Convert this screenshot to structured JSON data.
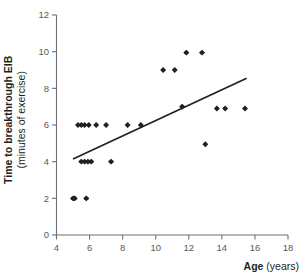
{
  "chart_data": {
    "type": "scatter",
    "title": "",
    "xlabel_bold": "Age",
    "xlabel_rest": " (years)",
    "ylabel_bold": "Time to breakthrough EIB",
    "ylabel_rest": "(minutes of exercise)",
    "xlim": [
      4,
      18
    ],
    "ylim": [
      0,
      12
    ],
    "xticks": [
      4,
      6,
      8,
      10,
      12,
      14,
      16,
      18
    ],
    "yticks": [
      0,
      2,
      4,
      6,
      8,
      10,
      12
    ],
    "grid": false,
    "legend": null,
    "marker_color": "#231f20",
    "axis_color": "#6d6e71",
    "trendline_color": "#231f20",
    "points": [
      {
        "x": 5.0,
        "y": 2.0
      },
      {
        "x": 5.1,
        "y": 2.0
      },
      {
        "x": 5.8,
        "y": 2.0
      },
      {
        "x": 5.5,
        "y": 4.0
      },
      {
        "x": 5.7,
        "y": 4.0
      },
      {
        "x": 5.9,
        "y": 4.0
      },
      {
        "x": 6.1,
        "y": 4.0
      },
      {
        "x": 7.3,
        "y": 4.0
      },
      {
        "x": 5.3,
        "y": 6.0
      },
      {
        "x": 5.5,
        "y": 6.0
      },
      {
        "x": 5.7,
        "y": 6.0
      },
      {
        "x": 5.95,
        "y": 6.0
      },
      {
        "x": 6.4,
        "y": 6.0
      },
      {
        "x": 7.0,
        "y": 6.0
      },
      {
        "x": 8.3,
        "y": 6.0
      },
      {
        "x": 9.1,
        "y": 6.0
      },
      {
        "x": 11.6,
        "y": 7.0
      },
      {
        "x": 13.7,
        "y": 6.9
      },
      {
        "x": 14.2,
        "y": 6.9
      },
      {
        "x": 15.4,
        "y": 6.9
      },
      {
        "x": 13.0,
        "y": 4.95
      },
      {
        "x": 10.45,
        "y": 9.0
      },
      {
        "x": 11.15,
        "y": 9.0
      },
      {
        "x": 11.85,
        "y": 9.95
      },
      {
        "x": 12.8,
        "y": 9.95
      }
    ],
    "trendline": {
      "x_start": 5.0,
      "y_start": 4.15,
      "x_end": 15.5,
      "y_end": 8.55
    }
  }
}
